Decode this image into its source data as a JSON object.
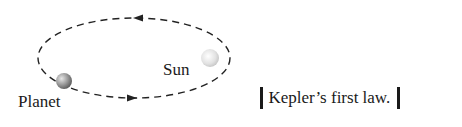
{
  "diagram": {
    "orbit": {
      "cx": 134,
      "cy": 58,
      "rx": 96,
      "ry": 40,
      "stroke": "#222222",
      "dash": "7 5"
    },
    "planet": {
      "label": "Planet",
      "cx": 64,
      "cy": 81,
      "r": 8,
      "color": "#9a9a9a"
    },
    "sun": {
      "label": "Sun",
      "cx": 210,
      "cy": 58,
      "r": 9,
      "color": "#dcdcdc"
    },
    "arrows": [
      {
        "direction": "left",
        "x": 140,
        "y": 18
      },
      {
        "direction": "right",
        "x": 130,
        "y": 98
      }
    ]
  },
  "caption": {
    "text": "Kepler’s first law."
  }
}
